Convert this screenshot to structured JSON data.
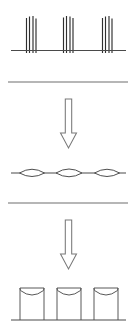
{
  "figure": {
    "width": 137,
    "height": 331,
    "background_color": "#ffffff",
    "stage_count": 3,
    "arrow_count": 2,
    "divider_count": 2,
    "caption": ""
  },
  "colors": {
    "background": "#ffffff",
    "filament_stroke": "#2e2e2e",
    "baseline_stroke": "#4a4a4a",
    "divider_stroke": "#6f6f6f",
    "arrow_stroke": "#787878",
    "arrow_fill": "#ffffff",
    "lens_stroke": "#4f4f4f",
    "lens_fill": "#ffffff",
    "pillar_stroke": "#585858",
    "pillar_fill": "#ffffff"
  },
  "stages": [
    {
      "id": "stage-1",
      "name": "filament-clusters",
      "label": "",
      "description": "Three clusters of thin vertical filaments standing on a horizontal substrate line",
      "baseline": {
        "y": 50.5,
        "x_start": 11,
        "x_end": 126
      },
      "cluster_count": 3,
      "clusters": [
        {
          "id": "cluster-1",
          "center_x": 31,
          "filament_count": 4,
          "filament_x": [
            26.5,
            29.5,
            33.0,
            36.0
          ],
          "filament_top_y": [
            18.0,
            16.5,
            16.0,
            18.5
          ],
          "filament_bottom_y": 53.0
        },
        {
          "id": "cluster-2",
          "center_x": 68,
          "filament_count": 4,
          "filament_x": [
            63.5,
            66.5,
            70.0,
            73.0
          ],
          "filament_top_y": [
            17.5,
            16.0,
            16.5,
            18.0
          ],
          "filament_bottom_y": 53.0
        },
        {
          "id": "cluster-3",
          "center_x": 107,
          "filament_count": 4,
          "filament_x": [
            102.5,
            105.5,
            109.0,
            112.0
          ],
          "filament_top_y": [
            18.0,
            16.5,
            16.0,
            18.5
          ],
          "filament_bottom_y": 53.0
        }
      ]
    },
    {
      "id": "stage-2",
      "name": "lens-features",
      "label": "",
      "description": "Three flattened lens or spindle shaped features distributed along a horizontal line",
      "baseline": {
        "y": 173.0,
        "x_start": 11,
        "x_end": 126
      },
      "lens_count": 3,
      "lenses": [
        {
          "id": "lens-1",
          "center_x": 32,
          "half_width": 12.5,
          "half_height": 5.0
        },
        {
          "id": "lens-2",
          "center_x": 69,
          "half_width": 13.0,
          "half_height": 5.5
        },
        {
          "id": "lens-3",
          "center_x": 107,
          "half_width": 12.5,
          "half_height": 5.0
        }
      ]
    },
    {
      "id": "stage-3",
      "name": "pillar-array",
      "label": "",
      "description": "Three vertical cylindrical pillars with concave dished tops resting on a baseline",
      "baseline": {
        "y": 320.0,
        "x_start": 11,
        "x_end": 126
      },
      "pillar_count": 3,
      "pillar_top_y": 288.0,
      "pillar_bottom_y": 320.0,
      "pillars": [
        {
          "id": "pillar-1",
          "left_x": 20.0,
          "right_x": 44.0,
          "dish_depth": 7.0,
          "rim_rise": 2.5
        },
        {
          "id": "pillar-2",
          "left_x": 57.0,
          "right_x": 81.0,
          "dish_depth": 7.0,
          "rim_rise": 2.5
        },
        {
          "id": "pillar-3",
          "left_x": 94.0,
          "right_x": 118.0,
          "dish_depth": 7.0,
          "rim_rise": 2.5
        }
      ]
    }
  ],
  "dividers": [
    {
      "id": "divider-1",
      "y": 82.0,
      "x_start": 8,
      "x_end": 128
    },
    {
      "id": "divider-2",
      "y": 203.0,
      "x_start": 8,
      "x_end": 128
    }
  ],
  "arrows": [
    {
      "id": "arrow-1",
      "direction": "down",
      "center_x": 68.5,
      "shaft_top_y": 99.0,
      "shaft_bottom_y": 133.0,
      "shaft_half_width": 3.2,
      "head_half_width": 8.0,
      "tip_y": 148.0
    },
    {
      "id": "arrow-2",
      "direction": "down",
      "center_x": 68.5,
      "shaft_top_y": 220.0,
      "shaft_bottom_y": 254.0,
      "shaft_half_width": 3.2,
      "head_half_width": 8.0,
      "tip_y": 269.0
    }
  ],
  "accessibility": {
    "summary": "Schematic diagram in three panels separated by horizontal rules. Top panel: three clusters of vertical filaments on a substrate. Middle panel: three lens shaped features on a line. Bottom panel: three cylindrical pillars with concave tops on a baseline. Downward arrows connect the panels."
  }
}
